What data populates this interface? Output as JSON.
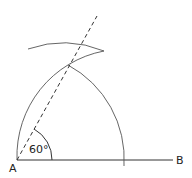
{
  "diagram": {
    "points": {
      "A": {
        "label": "A",
        "x": 17,
        "y": 160
      },
      "B": {
        "label": "B",
        "x": 180,
        "y": 160
      },
      "intersection": {
        "x": 70,
        "y": 65
      }
    },
    "angle_label": "60°",
    "colors": {
      "stroke": "#333333",
      "label": "#222222",
      "background": "#ffffff"
    }
  }
}
